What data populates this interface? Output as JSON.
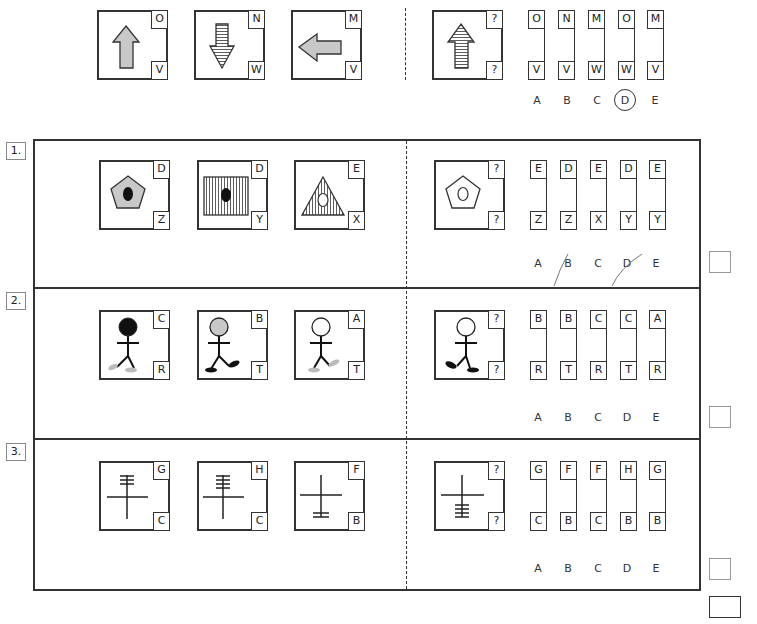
{
  "example": {
    "items": [
      {
        "shape": "arrow-up-gray",
        "top": "O",
        "bottom": "V"
      },
      {
        "shape": "arrow-down-striped",
        "top": "N",
        "bottom": "W"
      },
      {
        "shape": "arrow-left-gray",
        "top": "M",
        "bottom": "V"
      }
    ],
    "question": {
      "shape": "arrow-up-striped",
      "top": "?",
      "bottom": "?"
    },
    "options": [
      {
        "label": "A",
        "top": "O",
        "bottom": "V"
      },
      {
        "label": "B",
        "top": "N",
        "bottom": "V"
      },
      {
        "label": "C",
        "top": "M",
        "bottom": "W"
      },
      {
        "label": "D",
        "top": "O",
        "bottom": "W",
        "circled": true
      },
      {
        "label": "E",
        "top": "M",
        "bottom": "V"
      }
    ]
  },
  "questions": [
    {
      "number": "1.",
      "items": [
        {
          "shape": "pentagon-gray-black-dot",
          "top": "D",
          "bottom": "Z"
        },
        {
          "shape": "rectangle-striped-black-dot",
          "top": "D",
          "bottom": "Y"
        },
        {
          "shape": "triangle-striped-white-dot",
          "top": "E",
          "bottom": "X"
        }
      ],
      "question": {
        "shape": "pentagon-white-white-dot",
        "top": "?",
        "bottom": "?"
      },
      "options": [
        {
          "label": "A",
          "top": "E",
          "bottom": "Z"
        },
        {
          "label": "B",
          "top": "D",
          "bottom": "Z"
        },
        {
          "label": "C",
          "top": "E",
          "bottom": "X"
        },
        {
          "label": "D",
          "top": "D",
          "bottom": "Y"
        },
        {
          "label": "E",
          "top": "E",
          "bottom": "Y"
        }
      ]
    },
    {
      "number": "2.",
      "items": [
        {
          "shape": "stickman-black-head-gray-feet",
          "top": "C",
          "bottom": "R"
        },
        {
          "shape": "stickman-gray-head-black-feet",
          "top": "B",
          "bottom": "T"
        },
        {
          "shape": "stickman-white-head-gray-feet",
          "top": "A",
          "bottom": "T"
        }
      ],
      "question": {
        "shape": "stickman-white-head-black-feet",
        "top": "?",
        "bottom": "?"
      },
      "options": [
        {
          "label": "A",
          "top": "B",
          "bottom": "R"
        },
        {
          "label": "B",
          "top": "B",
          "bottom": "T"
        },
        {
          "label": "C",
          "top": "C",
          "bottom": "R"
        },
        {
          "label": "D",
          "top": "C",
          "bottom": "T"
        },
        {
          "label": "E",
          "top": "A",
          "bottom": "R"
        }
      ]
    },
    {
      "number": "3.",
      "items": [
        {
          "shape": "cross-three-bars-top",
          "top": "G",
          "bottom": "C"
        },
        {
          "shape": "cross-four-bars-top",
          "top": "H",
          "bottom": "C"
        },
        {
          "shape": "cross-two-bars-bottom",
          "top": "F",
          "bottom": "B"
        }
      ],
      "question": {
        "shape": "cross-four-bars-bottom",
        "top": "?",
        "bottom": "?"
      },
      "options": [
        {
          "label": "A",
          "top": "G",
          "bottom": "C"
        },
        {
          "label": "B",
          "top": "F",
          "bottom": "B"
        },
        {
          "label": "C",
          "top": "F",
          "bottom": "C"
        },
        {
          "label": "D",
          "top": "H",
          "bottom": "B"
        },
        {
          "label": "E",
          "top": "G",
          "bottom": "B"
        }
      ]
    }
  ]
}
